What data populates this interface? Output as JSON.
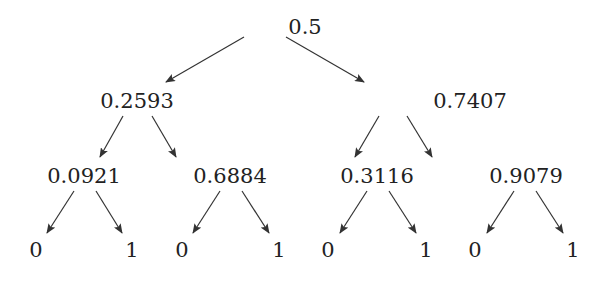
{
  "tree": {
    "root": {
      "label": "0.5",
      "x": 305,
      "y": 27
    },
    "level1": [
      {
        "label": "0.2593",
        "x": 137,
        "y": 101
      },
      {
        "label": "0.7407",
        "x": 470,
        "y": 101
      }
    ],
    "level2": [
      {
        "label": "0.0921",
        "x": 84,
        "y": 176
      },
      {
        "label": "0.6884",
        "x": 230,
        "y": 176
      },
      {
        "label": "0.3116",
        "x": 377,
        "y": 176
      },
      {
        "label": "0.9079",
        "x": 526,
        "y": 176
      }
    ],
    "leaves": [
      {
        "label": "0",
        "x": 36,
        "y": 250
      },
      {
        "label": "1",
        "x": 132,
        "y": 250
      },
      {
        "label": "0",
        "x": 182,
        "y": 250
      },
      {
        "label": "1",
        "x": 279,
        "y": 250
      },
      {
        "label": "0",
        "x": 328,
        "y": 250
      },
      {
        "label": "1",
        "x": 426,
        "y": 250
      },
      {
        "label": "0",
        "x": 475,
        "y": 250
      },
      {
        "label": "1",
        "x": 573,
        "y": 250
      }
    ]
  },
  "colors": {
    "text": "#222222",
    "edge": "#333333",
    "background": "#ffffff"
  }
}
